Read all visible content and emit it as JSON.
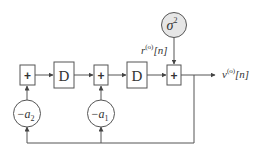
{
  "diagram": {
    "type": "block-diagram",
    "colors": {
      "stroke": "#555555",
      "text": "#333333",
      "source_fill": "#e6e6e6",
      "background": "#ffffff"
    },
    "source": {
      "label": "σ",
      "superscript": "2"
    },
    "input_signal": {
      "base": "r",
      "superscript": "(o)",
      "argument": "[n]"
    },
    "output_signal": {
      "base": "v",
      "superscript": "(o)",
      "argument": "[n]"
    },
    "summers": [
      {
        "id": "sum1",
        "label": "+"
      },
      {
        "id": "sum2",
        "label": "+"
      },
      {
        "id": "sum3",
        "label": "+"
      }
    ],
    "delays": [
      {
        "id": "delay1",
        "label": "D"
      },
      {
        "id": "delay2",
        "label": "D"
      }
    ],
    "gains": [
      {
        "id": "gain-a2",
        "sign": "−",
        "base": "a",
        "subscript": "2"
      },
      {
        "id": "gain-a1",
        "sign": "−",
        "base": "a",
        "subscript": "1"
      }
    ]
  }
}
